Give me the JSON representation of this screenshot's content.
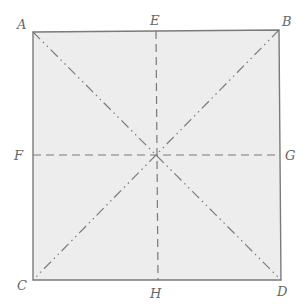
{
  "diagram": {
    "type": "folding-square",
    "colors": {
      "fill": "#ededed",
      "stroke": "#7a7a7a",
      "label": "#666666"
    },
    "points": {
      "A": {
        "label": "A",
        "x": 33,
        "y": 32
      },
      "B": {
        "label": "B",
        "x": 279,
        "y": 30
      },
      "C": {
        "label": "C",
        "x": 33,
        "y": 280
      },
      "D": {
        "label": "D",
        "x": 281,
        "y": 280
      },
      "E": {
        "label": "E",
        "x": 156,
        "y": 31
      },
      "F": {
        "label": "F",
        "x": 33,
        "y": 155
      },
      "G": {
        "label": "G",
        "x": 280,
        "y": 155
      },
      "H": {
        "label": "H",
        "x": 158,
        "y": 280
      }
    },
    "lines": [
      {
        "from": "A",
        "to": "D",
        "style": "dash-dot-dot",
        "role": "diagonal"
      },
      {
        "from": "B",
        "to": "C",
        "style": "dash-dot-dot",
        "role": "diagonal"
      },
      {
        "from": "E",
        "to": "H",
        "style": "dashed",
        "role": "vertical-midline"
      },
      {
        "from": "F",
        "to": "G",
        "style": "dashed",
        "role": "horizontal-midline"
      }
    ]
  }
}
